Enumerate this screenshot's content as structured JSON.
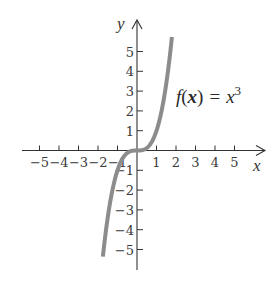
{
  "chart_data": {
    "type": "line",
    "title": "",
    "function": "f(x) = x^3",
    "annotation": {
      "f": "f",
      "open": "(",
      "x": "x",
      "close": ")",
      "equals": "=",
      "rhs_base": "x",
      "rhs_exp": "3"
    },
    "xlabel": "x",
    "ylabel": "y",
    "xlim": [
      -5.5,
      6.5
    ],
    "ylim": [
      -6,
      6.5
    ],
    "x_ticks": [
      -5,
      -4,
      -3,
      -2,
      -1,
      1,
      2,
      3,
      4,
      5
    ],
    "y_ticks": [
      5,
      4,
      3,
      2,
      1,
      -1,
      -2,
      -3,
      -4,
      -5
    ],
    "x_tick_labels": [
      "−5",
      "−4",
      "−3",
      "−2",
      "−1",
      "1",
      "2",
      "3",
      "4",
      "5"
    ],
    "y_tick_labels": [
      "5",
      "4",
      "3",
      "2",
      "1",
      "−1",
      "−2",
      "−3",
      "−4",
      "−5"
    ],
    "grid": false,
    "legend": "none",
    "series": [
      {
        "name": "f(x) = x^3",
        "color": "#8c8c8c",
        "x": [
          -1.75,
          -1.6,
          -1.4,
          -1.2,
          -1.0,
          -0.8,
          -0.6,
          -0.4,
          -0.2,
          0,
          0.2,
          0.4,
          0.6,
          0.8,
          1.0,
          1.2,
          1.4,
          1.6,
          1.8
        ],
        "y": [
          -5.36,
          -4.1,
          -2.74,
          -1.73,
          -1.0,
          -0.51,
          -0.22,
          -0.06,
          -0.01,
          0,
          0.01,
          0.06,
          0.22,
          0.51,
          1.0,
          1.73,
          2.74,
          4.1,
          5.83
        ]
      }
    ]
  },
  "colors": {
    "axis": "#333333",
    "curve": "#8c8c8c",
    "text": "#333333"
  }
}
